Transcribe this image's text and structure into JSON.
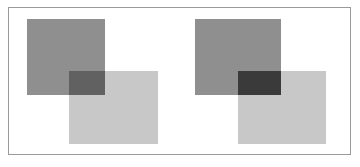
{
  "figure": {
    "canvas_width": 360,
    "canvas_height": 167,
    "background_color": "#ffffff",
    "frame": {
      "border_color": "#9a9a9a",
      "border_width": 1,
      "x": 8,
      "y": 7,
      "width": 343,
      "height": 148,
      "fill": "#ffffff"
    }
  },
  "palette": {
    "dark_square": "#8f8f8f",
    "light_square": "#c8c8c8",
    "overlap_light_blend": "#616161",
    "overlap_dark_blend": "#3a3a3a"
  },
  "pairs": [
    {
      "id": "left-pair",
      "label": "Left pair",
      "blend_result": "#616161",
      "back_square": {
        "label": "Upper-left dark square",
        "color": "#8f8f8f",
        "x": 27,
        "y": 19,
        "width": 78,
        "height": 76
      },
      "front_square": {
        "label": "Lower-right light square",
        "color": "#c8c8c8",
        "x": 69,
        "y": 71,
        "width": 89,
        "height": 73
      },
      "overlap": {
        "label": "Overlap region",
        "color": "#616161",
        "x": 69,
        "y": 71,
        "width": 36,
        "height": 24
      }
    },
    {
      "id": "right-pair",
      "label": "Right pair",
      "blend_result": "#3a3a3a",
      "back_square": {
        "label": "Upper-left dark square",
        "color": "#8f8f8f",
        "x": 195,
        "y": 19,
        "width": 86,
        "height": 76
      },
      "front_square": {
        "label": "Lower-right light square",
        "color": "#c8c8c8",
        "x": 238,
        "y": 71,
        "width": 88,
        "height": 73
      },
      "overlap": {
        "label": "Overlap region",
        "color": "#3a3a3a",
        "x": 238,
        "y": 71,
        "width": 43,
        "height": 24
      }
    }
  ]
}
